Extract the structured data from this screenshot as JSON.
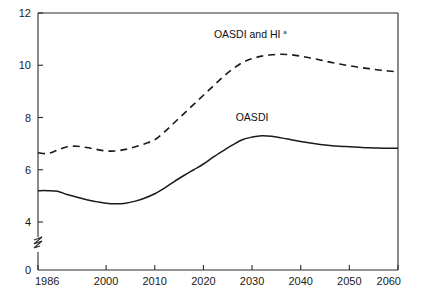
{
  "chart_data": {
    "type": "line",
    "title": "",
    "subtitle": "",
    "xlabel": "",
    "ylabel": "",
    "xlim": [
      1986,
      2060
    ],
    "ylim": [
      0,
      12
    ],
    "y_axis_break": true,
    "y_break_between": [
      0,
      4
    ],
    "grid": false,
    "legend_position": "inline-labels",
    "xticks": [
      1986,
      2000,
      2010,
      2020,
      2030,
      2040,
      2050,
      2060
    ],
    "xtick_labels": [
      "1986",
      "2000",
      "2010",
      "2020",
      "2030",
      "2040",
      "2050",
      "2060"
    ],
    "yticks": [
      0,
      4,
      6,
      8,
      10,
      12
    ],
    "ytick_labels": [
      "0",
      "4",
      "6",
      "8",
      "10",
      "12"
    ],
    "series": [
      {
        "name": "OASDI and HI",
        "label": "OASDI and HI",
        "footnote_marker": "a",
        "style": "dashed",
        "color": "#1a1a1a",
        "label_x": 2029,
        "label_y": 11.05,
        "x": [
          1986,
          1988,
          1990,
          1992,
          1994,
          1996,
          1998,
          2000,
          2002,
          2004,
          2006,
          2008,
          2010,
          2012,
          2014,
          2016,
          2018,
          2020,
          2022,
          2024,
          2026,
          2028,
          2030,
          2032,
          2034,
          2036,
          2038,
          2040,
          2042,
          2044,
          2046,
          2048,
          2050,
          2052,
          2054,
          2056,
          2058,
          2060
        ],
        "y": [
          6.65,
          6.62,
          6.75,
          6.88,
          6.9,
          6.85,
          6.78,
          6.72,
          6.72,
          6.78,
          6.88,
          7.0,
          7.15,
          7.45,
          7.8,
          8.15,
          8.5,
          8.85,
          9.2,
          9.55,
          9.85,
          10.1,
          10.25,
          10.35,
          10.4,
          10.42,
          10.4,
          10.35,
          10.28,
          10.2,
          10.12,
          10.05,
          9.98,
          9.92,
          9.87,
          9.82,
          9.78,
          9.75
        ]
      },
      {
        "name": "OASDI",
        "label": "OASDI",
        "footnote_marker": "",
        "style": "solid",
        "color": "#1a1a1a",
        "label_x": 2030,
        "label_y": 7.85,
        "x": [
          1986,
          1988,
          1990,
          1992,
          1994,
          1996,
          1998,
          2000,
          2002,
          2004,
          2006,
          2008,
          2010,
          2012,
          2014,
          2016,
          2018,
          2020,
          2022,
          2024,
          2026,
          2028,
          2030,
          2032,
          2034,
          2036,
          2038,
          2040,
          2042,
          2044,
          2046,
          2048,
          2050,
          2052,
          2054,
          2056,
          2058,
          2060
        ],
        "y": [
          5.2,
          5.2,
          5.18,
          5.05,
          4.95,
          4.85,
          4.78,
          4.72,
          4.7,
          4.72,
          4.8,
          4.92,
          5.08,
          5.3,
          5.55,
          5.78,
          6.0,
          6.22,
          6.48,
          6.72,
          6.95,
          7.15,
          7.25,
          7.3,
          7.28,
          7.22,
          7.15,
          7.08,
          7.02,
          6.97,
          6.93,
          6.9,
          6.88,
          6.86,
          6.84,
          6.83,
          6.82,
          6.82
        ]
      }
    ]
  },
  "colors": {
    "axis": "#1a1a1a",
    "series_primary": "#1a1a1a",
    "background": "#ffffff"
  }
}
